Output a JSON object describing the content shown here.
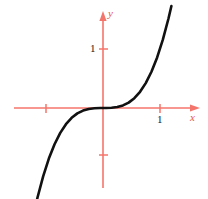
{
  "figure": {
    "name": "cubic-function-graph",
    "background_color": "#ffffff",
    "width": 208,
    "height": 199
  },
  "axes": {
    "color": "#f4756b",
    "line_width": 1.6,
    "origin": {
      "x": 103,
      "y": 108
    },
    "x_axis": {
      "label": "x",
      "label_color": "#e8564a",
      "start_x": 14,
      "end_x": 200,
      "arrow": "right"
    },
    "y_axis": {
      "label": "y",
      "label_color": "#e8564a",
      "start_y": 188,
      "end_y": 12,
      "arrow": "up"
    },
    "ticks": [
      {
        "axis": "y",
        "label": "1",
        "pixel": 49,
        "value": 1
      },
      {
        "axis": "y",
        "label": "",
        "pixel": 155,
        "value": -1
      },
      {
        "axis": "x",
        "label": "1",
        "pixel": 160,
        "value": 1
      },
      {
        "axis": "x",
        "label": "",
        "pixel": 46,
        "value": -1
      }
    ]
  },
  "chart_data": {
    "type": "line",
    "title": "",
    "subtitle": "",
    "xlabel": "x",
    "ylabel": "y",
    "grid": false,
    "legend": null,
    "curve_color": "#111111",
    "curve_width": 2.6,
    "function": "y = x^3",
    "xlim": [
      -1.55,
      1.3
    ],
    "ylim": [
      -2.2,
      1.65
    ],
    "x": [
      -1.55,
      -1.45,
      -1.35,
      -1.25,
      -1.15,
      -1.05,
      -0.95,
      -0.85,
      -0.75,
      -0.65,
      -0.55,
      -0.45,
      -0.35,
      -0.25,
      -0.15,
      -0.05,
      0,
      0.05,
      0.15,
      0.25,
      0.35,
      0.45,
      0.55,
      0.65,
      0.75,
      0.85,
      0.95,
      1.05,
      1.15,
      1.2
    ],
    "values": [
      -3.724,
      -3.048,
      -2.46,
      -1.953,
      -1.521,
      -1.158,
      -0.857,
      -0.614,
      -0.422,
      -0.275,
      -0.166,
      -0.091,
      -0.043,
      -0.016,
      -0.003,
      0.0,
      0.0,
      0.0,
      0.003,
      0.016,
      0.043,
      0.091,
      0.166,
      0.275,
      0.422,
      0.614,
      0.857,
      1.158,
      1.521,
      1.728
    ],
    "series": [
      {
        "name": "y = x^3",
        "values": [
          -3.724,
          -3.048,
          -2.46,
          -1.953,
          -1.521,
          -1.158,
          -0.857,
          -0.614,
          -0.422,
          -0.275,
          -0.166,
          -0.091,
          -0.043,
          -0.016,
          -0.003,
          0.0,
          0.0,
          0.0,
          0.003,
          0.016,
          0.043,
          0.091,
          0.166,
          0.275,
          0.422,
          0.614,
          0.857,
          1.158,
          1.521,
          1.728
        ]
      }
    ],
    "annotations": [],
    "inflection_point": {
      "x": 0,
      "y": 0
    },
    "curve_endpoints": {
      "lower_left_pixel": {
        "x": 44,
        "y": 181
      },
      "upper_right_pixel": {
        "x": 168,
        "y": 29
      }
    }
  }
}
